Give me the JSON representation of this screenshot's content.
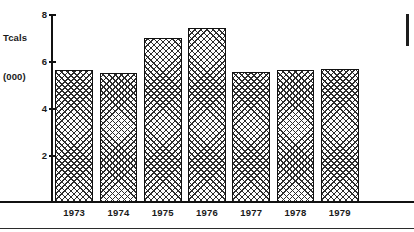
{
  "chart_data": {
    "type": "bar",
    "title": "",
    "subtitle": "",
    "xlabel": "",
    "ylabel": "Tcals (000)",
    "ylabel_lines": [
      "Tcals",
      "(000)"
    ],
    "categories": [
      "1973",
      "1974",
      "1975",
      "1976",
      "1977",
      "1978",
      "1979"
    ],
    "values": [
      5.6,
      5.5,
      7.0,
      7.4,
      5.55,
      5.6,
      5.65
    ],
    "series": [
      {
        "name": "Tcals (000)",
        "values": [
          5.6,
          5.5,
          7.0,
          7.4,
          5.55,
          5.6,
          5.65
        ]
      }
    ],
    "ylim": [
      0,
      8
    ],
    "y_ticks": [
      8,
      6,
      4,
      2
    ],
    "y_tick_labels": [
      "8",
      "6",
      "4",
      "2"
    ],
    "grid": false,
    "legend": false,
    "legend_position": "none",
    "bar_fill": "cross-hatch",
    "annotations": []
  },
  "figure": {
    "axis_title": {
      "line1": "Tcals",
      "line2": "(000)"
    },
    "colors": {
      "ink": "#111111",
      "hatch": "#2d2d2d",
      "background": "#ffffff"
    }
  }
}
